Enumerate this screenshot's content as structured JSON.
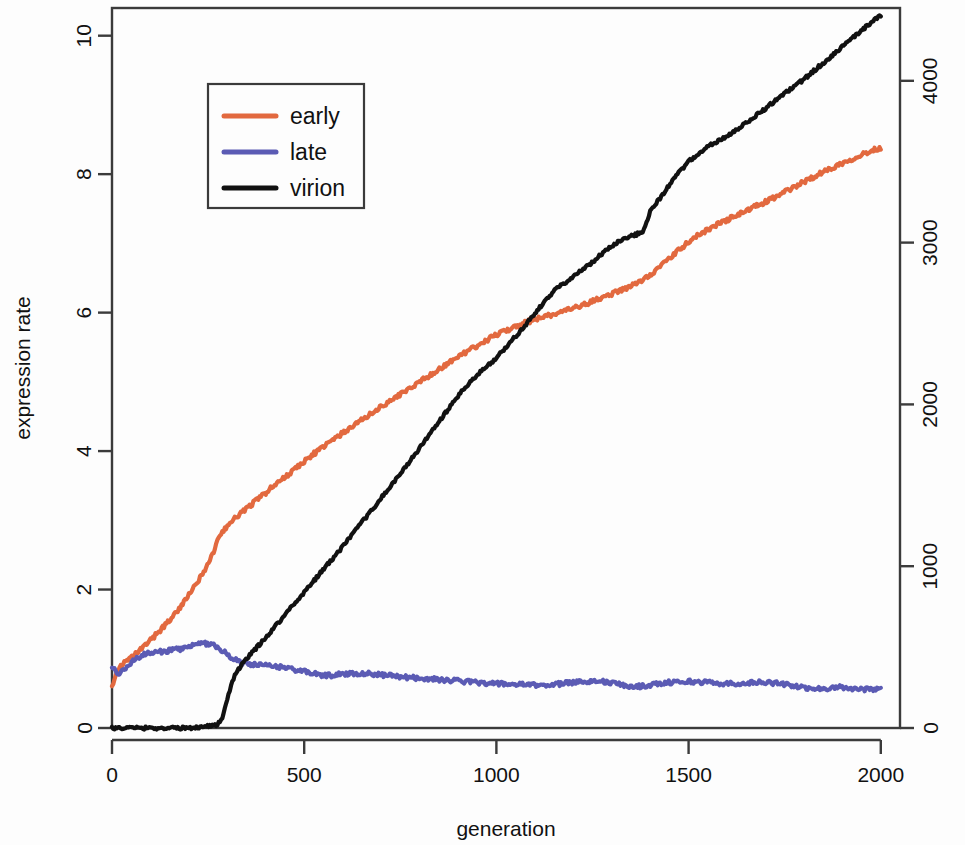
{
  "chart_data": {
    "type": "line",
    "title": "",
    "xlabel": "generation",
    "ylabel": "expression rate",
    "y2label": "",
    "xlim": [
      0,
      2050
    ],
    "ylim": [
      0,
      10.4
    ],
    "y2lim": [
      0,
      4450
    ],
    "grid": false,
    "legend_position": "top-left",
    "xticks": [
      0,
      500,
      1000,
      1500,
      2000
    ],
    "xtick_labels": [
      "0",
      "500",
      "1000",
      "1500",
      "2000"
    ],
    "yticks": [
      0,
      2,
      4,
      6,
      8,
      10
    ],
    "ytick_labels": [
      "0",
      "2",
      "4",
      "6",
      "8",
      "10"
    ],
    "y2ticks": [
      0,
      1000,
      2000,
      3000,
      4000
    ],
    "y2tick_labels": [
      "0",
      "1000",
      "2000",
      "3000",
      "4000"
    ],
    "colors": {
      "early": "#E2693F",
      "late": "#5B5BB4",
      "virion": "#111111",
      "frame": "#3b3b3b",
      "background": "#fdfdfd"
    },
    "series": [
      {
        "name": "early",
        "axis": "left",
        "color": "#E2693F",
        "x": [
          0,
          10,
          20,
          30,
          45,
          60,
          80,
          100,
          125,
          150,
          175,
          200,
          225,
          250,
          265,
          280,
          300,
          330,
          360,
          400,
          440,
          480,
          520,
          560,
          600,
          650,
          700,
          750,
          800,
          850,
          900,
          950,
          1000,
          1050,
          1100,
          1150,
          1200,
          1250,
          1300,
          1350,
          1400,
          1450,
          1500,
          1550,
          1600,
          1650,
          1700,
          1750,
          1800,
          1850,
          1900,
          1950,
          2000
        ],
        "y": [
          0.62,
          0.78,
          0.88,
          0.93,
          0.99,
          1.06,
          1.16,
          1.27,
          1.41,
          1.56,
          1.73,
          1.92,
          2.13,
          2.37,
          2.55,
          2.78,
          2.92,
          3.08,
          3.22,
          3.4,
          3.58,
          3.76,
          3.94,
          4.1,
          4.26,
          4.45,
          4.64,
          4.82,
          5.0,
          5.18,
          5.36,
          5.52,
          5.68,
          5.8,
          5.9,
          5.98,
          6.06,
          6.16,
          6.27,
          6.38,
          6.55,
          6.78,
          7.02,
          7.2,
          7.34,
          7.47,
          7.6,
          7.74,
          7.89,
          8.03,
          8.16,
          8.28,
          8.38
        ]
      },
      {
        "name": "late",
        "axis": "left",
        "color": "#5B5BB4",
        "x": [
          0,
          10,
          20,
          30,
          45,
          60,
          80,
          100,
          125,
          150,
          175,
          200,
          225,
          250,
          265,
          280,
          300,
          330,
          360,
          400,
          440,
          480,
          520,
          560,
          600,
          650,
          700,
          750,
          800,
          850,
          900,
          950,
          1000,
          1050,
          1100,
          1150,
          1200,
          1250,
          1300,
          1350,
          1400,
          1450,
          1500,
          1550,
          1600,
          1650,
          1700,
          1750,
          1800,
          1850,
          1900,
          1950,
          2000
        ],
        "y": [
          0.88,
          0.82,
          0.8,
          0.84,
          0.92,
          0.99,
          1.05,
          1.08,
          1.1,
          1.12,
          1.14,
          1.17,
          1.21,
          1.22,
          1.2,
          1.14,
          1.06,
          0.96,
          0.92,
          0.9,
          0.88,
          0.84,
          0.79,
          0.76,
          0.78,
          0.79,
          0.77,
          0.74,
          0.72,
          0.7,
          0.68,
          0.66,
          0.64,
          0.63,
          0.62,
          0.63,
          0.66,
          0.68,
          0.65,
          0.6,
          0.62,
          0.66,
          0.67,
          0.66,
          0.64,
          0.65,
          0.66,
          0.63,
          0.58,
          0.57,
          0.59,
          0.56,
          0.57
        ]
      },
      {
        "name": "virion",
        "axis": "right",
        "color": "#111111",
        "x": [
          0,
          50,
          100,
          150,
          200,
          240,
          270,
          285,
          300,
          320,
          350,
          400,
          450,
          500,
          550,
          600,
          650,
          700,
          750,
          800,
          850,
          900,
          950,
          1000,
          1050,
          1100,
          1150,
          1200,
          1250,
          1300,
          1350,
          1380,
          1400,
          1430,
          1460,
          1500,
          1550,
          1600,
          1650,
          1700,
          1750,
          1800,
          1850,
          1900,
          1950,
          2000
        ],
        "y": [
          0,
          0,
          0,
          0,
          0,
          10,
          20,
          55,
          180,
          330,
          430,
          560,
          700,
          840,
          980,
          1120,
          1270,
          1420,
          1570,
          1730,
          1890,
          2050,
          2180,
          2290,
          2420,
          2560,
          2700,
          2790,
          2880,
          2980,
          3040,
          3070,
          3190,
          3290,
          3390,
          3500,
          3590,
          3660,
          3740,
          3830,
          3920,
          4010,
          4110,
          4210,
          4310,
          4400
        ]
      }
    ],
    "legend_entries": [
      {
        "label": "early",
        "color": "#E2693F"
      },
      {
        "label": "late",
        "color": "#5B5BB4"
      },
      {
        "label": "virion",
        "color": "#111111"
      }
    ]
  }
}
